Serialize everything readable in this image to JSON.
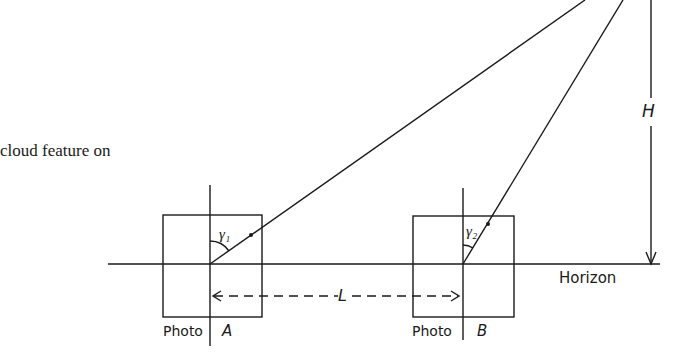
{
  "caption_fragment": "cloud feature on",
  "labels": {
    "height": "H",
    "horizon": "Horizon",
    "baseline": "L",
    "photo_a_word": "Photo",
    "photo_a_letter": "A",
    "photo_b_word": "Photo",
    "photo_b_letter": "B",
    "angle_1": "γ₁",
    "angle_2": "γ₂"
  },
  "colors": {
    "line": "#1a1a1a",
    "background": "#ffffff"
  }
}
